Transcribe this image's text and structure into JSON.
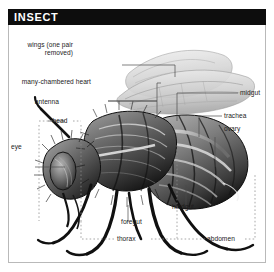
{
  "header": {
    "title": "INSECT"
  },
  "figure": {
    "colors": {
      "title_bar": "#0d0d0d",
      "title_text": "#ffffff",
      "frame_border": "#b9b9b9",
      "background": "#ffffff",
      "leader_line": "#4a4a4a",
      "bracket_line": "#8c8c8c",
      "label_text": "#1c1c1c",
      "wing_fill": "#dcdcdc",
      "body_dark": "#161616",
      "body_mid": "#6e6e6e",
      "body_light": "#c8c8c8"
    },
    "labels": [
      {
        "id": "wings",
        "text": "wings (one pair removed)",
        "x": 44,
        "y": 47,
        "align": "right"
      },
      {
        "id": "heart",
        "text": "many-chambered heart",
        "x": 26,
        "y": 84,
        "align": "right"
      },
      {
        "id": "antenna",
        "text": "antenna",
        "x": 58,
        "y": 104,
        "align": "right"
      },
      {
        "id": "head",
        "text": "head",
        "x": 50,
        "y": 120,
        "align": "center"
      },
      {
        "id": "eye",
        "text": "eye",
        "x": 11,
        "y": 150,
        "align": "left"
      },
      {
        "id": "midgut",
        "text": "midgut",
        "x": 238,
        "y": 76,
        "align": "left"
      },
      {
        "id": "trachea",
        "text": "trachea",
        "x": 222,
        "y": 99,
        "align": "left"
      },
      {
        "id": "ovary",
        "text": "ovary",
        "x": 222,
        "y": 112,
        "align": "left"
      },
      {
        "id": "hindgut",
        "text": "hindgut",
        "x": 178,
        "y": 188,
        "align": "left"
      },
      {
        "id": "foregut",
        "text": "foregut",
        "x": 127,
        "y": 203,
        "align": "left"
      },
      {
        "id": "thorax",
        "text": "thorax",
        "x": 117,
        "y": 222,
        "align": "left"
      },
      {
        "id": "abdomen",
        "text": "abdomen",
        "x": 206,
        "y": 222,
        "align": "left"
      }
    ]
  }
}
